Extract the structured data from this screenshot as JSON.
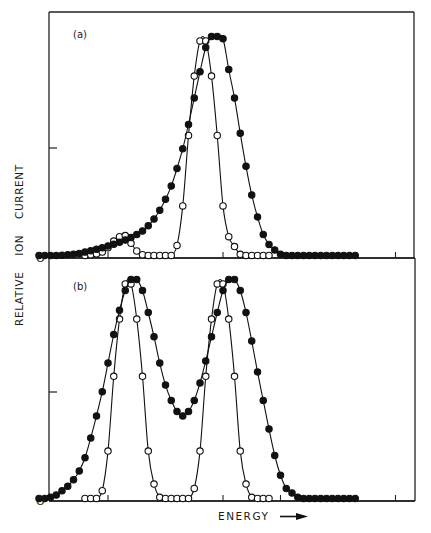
{
  "chart_data": [
    {
      "type": "line",
      "panel": "(a)",
      "title": "",
      "xlabel": "ENERGY",
      "ylabel": "RELATIVE ION CURRENT",
      "y_tick_labels": [
        "0"
      ],
      "grid": false,
      "xlim": [
        -0.45,
        5.9
      ],
      "ylim": [
        0,
        1.0
      ],
      "series": [
        {
          "name": "filled circles",
          "marker": "filled",
          "x": [
            -0.2,
            -0.1,
            0,
            0.1,
            0.2,
            0.3,
            0.4,
            0.5,
            0.6,
            0.7,
            0.8,
            0.9,
            1.0,
            1.1,
            1.2,
            1.3,
            1.4,
            1.5,
            1.6,
            1.7,
            1.8,
            1.9,
            2.0,
            2.1,
            2.2,
            2.3,
            2.4,
            2.5,
            2.6,
            2.7,
            2.8,
            2.9,
            3.0,
            3.1,
            3.2,
            3.3,
            3.4,
            3.5,
            3.6,
            3.7,
            3.8,
            3.9,
            4.0,
            4.1,
            4.2,
            4.3,
            4.4,
            4.5,
            4.6,
            4.7,
            4.8,
            4.9,
            5.0,
            5.1,
            5.2,
            5.3
          ],
          "y": [
            0.005,
            0.005,
            0.005,
            0.005,
            0.006,
            0.008,
            0.01,
            0.014,
            0.02,
            0.026,
            0.033,
            0.04,
            0.048,
            0.056,
            0.065,
            0.075,
            0.086,
            0.1,
            0.116,
            0.14,
            0.17,
            0.21,
            0.26,
            0.32,
            0.4,
            0.49,
            0.6,
            0.72,
            0.84,
            0.95,
            1.0,
            1.0,
            0.99,
            0.85,
            0.72,
            0.56,
            0.41,
            0.28,
            0.18,
            0.1,
            0.055,
            0.03,
            0.01,
            0.005,
            0.005,
            0.005,
            0.005,
            0.005,
            0.005,
            0.005,
            0.005,
            0.005,
            0.005,
            0.005,
            0.005,
            0.005
          ]
        },
        {
          "name": "open circles",
          "marker": "open",
          "x": [
            0.6,
            0.7,
            0.8,
            0.9,
            1.0,
            1.1,
            1.2,
            1.3,
            1.4,
            1.5,
            1.6,
            1.7,
            1.8,
            1.9,
            2.0,
            2.1,
            2.2,
            2.3,
            2.4,
            2.5,
            2.6,
            2.7,
            2.8,
            2.9,
            3.0,
            3.1,
            3.2,
            3.3,
            3.4,
            3.5,
            3.6,
            3.7,
            3.8
          ],
          "y": [
            0.005,
            0.008,
            0.012,
            0.02,
            0.04,
            0.07,
            0.09,
            0.095,
            0.06,
            0.025,
            0.008,
            0.005,
            0.005,
            0.005,
            0.005,
            0.005,
            0.05,
            0.23,
            0.55,
            0.82,
            0.98,
            0.98,
            0.82,
            0.55,
            0.23,
            0.09,
            0.045,
            0.01,
            0.005,
            0.005,
            0.005,
            0.005,
            0.005
          ]
        }
      ]
    },
    {
      "type": "line",
      "panel": "(b)",
      "title": "",
      "xlabel": "ENERGY",
      "ylabel": "RELATIVE ION CURRENT",
      "y_tick_labels": [
        "0"
      ],
      "grid": false,
      "xlim": [
        -0.45,
        5.9
      ],
      "ylim": [
        0,
        1.0
      ],
      "series": [
        {
          "name": "filled circles",
          "marker": "filled",
          "x": [
            -0.2,
            -0.1,
            0,
            0.1,
            0.2,
            0.3,
            0.4,
            0.5,
            0.6,
            0.7,
            0.8,
            0.9,
            1.0,
            1.1,
            1.2,
            1.3,
            1.4,
            1.5,
            1.6,
            1.7,
            1.8,
            1.9,
            2.0,
            2.1,
            2.2,
            2.3,
            2.4,
            2.5,
            2.6,
            2.7,
            2.8,
            2.9,
            3.0,
            3.1,
            3.2,
            3.3,
            3.4,
            3.5,
            3.6,
            3.7,
            3.8,
            3.9,
            4.0,
            4.1,
            4.2,
            4.3,
            4.4,
            4.5,
            4.6,
            4.7,
            4.8,
            4.9,
            5.0,
            5.1,
            5.2,
            5.3
          ],
          "y": [
            0.005,
            0.005,
            0.01,
            0.02,
            0.04,
            0.06,
            0.09,
            0.13,
            0.19,
            0.28,
            0.38,
            0.49,
            0.62,
            0.75,
            0.86,
            0.95,
            1.0,
            1.0,
            0.95,
            0.85,
            0.74,
            0.62,
            0.52,
            0.45,
            0.4,
            0.38,
            0.4,
            0.45,
            0.53,
            0.63,
            0.74,
            0.85,
            0.95,
            1.0,
            1.0,
            0.95,
            0.85,
            0.72,
            0.58,
            0.45,
            0.32,
            0.2,
            0.11,
            0.05,
            0.03,
            0.01,
            0.005,
            0.005,
            0.005,
            0.005,
            0.005,
            0.005,
            0.005,
            0.005,
            0.005,
            0.005
          ]
        },
        {
          "name": "open circles",
          "marker": "open",
          "x": [
            0.6,
            0.7,
            0.8,
            0.9,
            1.0,
            1.1,
            1.2,
            1.3,
            1.4,
            1.5,
            1.6,
            1.7,
            1.8,
            1.9,
            2.0,
            2.1,
            2.2,
            2.3,
            2.4,
            2.5,
            2.6,
            2.7,
            2.8,
            2.9,
            3.0,
            3.1,
            3.2,
            3.3,
            3.4,
            3.5,
            3.6,
            3.7,
            3.8
          ],
          "y": [
            0.005,
            0.005,
            0.005,
            0.04,
            0.22,
            0.56,
            0.82,
            0.98,
            0.98,
            0.82,
            0.56,
            0.22,
            0.07,
            0.01,
            0.005,
            0.005,
            0.005,
            0.005,
            0.005,
            0.05,
            0.22,
            0.56,
            0.82,
            0.98,
            0.98,
            0.82,
            0.56,
            0.22,
            0.07,
            0.01,
            0.005,
            0.005,
            0.005
          ]
        }
      ]
    }
  ],
  "labels": {
    "panel_a": "(a)",
    "panel_b": "(b)",
    "ylabel": "RELATIVE    ION    CURRENT",
    "zero_a": "O",
    "zero_b": "O",
    "xlabel": "ENERGY"
  }
}
